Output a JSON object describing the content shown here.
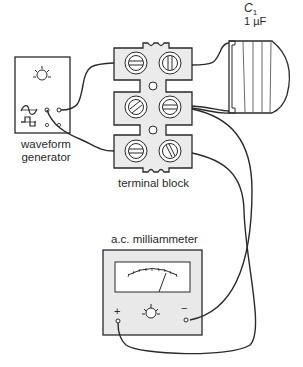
{
  "diagram": {
    "waveform_generator": {
      "label_line1": "waveform",
      "label_line2": "generator",
      "controls": [
        "sine-wave-icon",
        "square-wave-icon",
        "control-knob"
      ]
    },
    "terminal_block": {
      "label": "terminal block",
      "terminals": 6
    },
    "capacitor": {
      "name": "C",
      "subscript": "1",
      "value": "1 µF"
    },
    "milliammeter": {
      "label": "a.c. milliammeter",
      "plus_symbol": "+",
      "minus_symbol": "−"
    },
    "colors": {
      "line": "#2a2a2a",
      "panel_fill": "#e9e9e9",
      "background": "#ffffff"
    }
  }
}
